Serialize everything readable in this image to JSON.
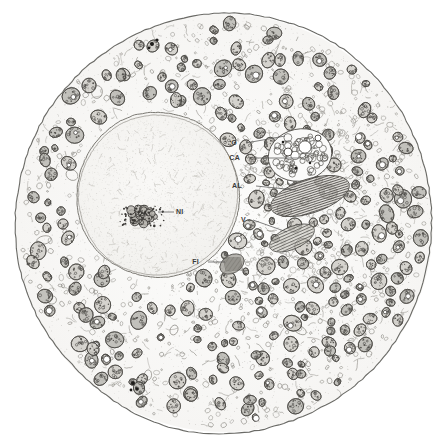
{
  "figure": {
    "kind": "electron-micrograph-drawing",
    "background_color": "#ffffff",
    "ink_color": "#4a4a4a",
    "cytoplasm_tone": "#fbfbfa",
    "nucleoplasm_tone": "#f7f6f4",
    "width": 445,
    "height": 445
  },
  "cell": {
    "center_x": 224,
    "center_y": 223,
    "radius": 209,
    "membrane_color": "#6a6a66"
  },
  "nucleus": {
    "center_x": 158,
    "center_y": 195,
    "radius": 82,
    "envelope_color": "#7a7872"
  },
  "labels": [
    {
      "id": "G",
      "text": "G",
      "x": 237,
      "y": 145,
      "lx1": 246,
      "ly1": 143,
      "lx2": 285,
      "ly2": 136
    },
    {
      "id": "CA",
      "text": "CA",
      "x": 240,
      "y": 160,
      "lx1": 254,
      "ly1": 158,
      "lx2": 300,
      "ly2": 158
    },
    {
      "id": "AL",
      "text": "AL",
      "x": 242,
      "y": 188,
      "lx1": 256,
      "ly1": 186,
      "lx2": 296,
      "ly2": 190
    },
    {
      "id": "V",
      "text": "V",
      "x": 246,
      "y": 222,
      "lx1": 253,
      "ly1": 220,
      "lx2": 287,
      "ly2": 232
    },
    {
      "id": "FI",
      "text": "FI",
      "x": 199,
      "y": 264,
      "lx1": 208,
      "ly1": 262,
      "lx2": 225,
      "ly2": 262
    },
    {
      "id": "NI",
      "text": "NI",
      "x": 176,
      "y": 214,
      "lx1": 174,
      "ly1": 212,
      "lx2": 158,
      "ly2": 212
    }
  ],
  "label_glossary": [
    {
      "id": "G",
      "meaning": "Golgi"
    },
    {
      "id": "CA",
      "meaning": "Canaliculus / vacuolar body"
    },
    {
      "id": "AL",
      "meaning": "Annulate lamellae"
    },
    {
      "id": "V",
      "meaning": "Vesicles"
    },
    {
      "id": "FI",
      "meaning": "Fibrillar body"
    },
    {
      "id": "NI",
      "meaning": "Nucleolus"
    }
  ],
  "structures": {
    "nucleolus": {
      "center_x": 142,
      "center_y": 215,
      "width": 44,
      "height": 22
    },
    "annulate_lamellae": {
      "center_x": 310,
      "center_y": 196,
      "width": 82,
      "height": 34,
      "angle": -18,
      "stripes": 15
    },
    "canalicular_body": {
      "center_x": 300,
      "center_y": 155,
      "width": 64,
      "height": 52
    },
    "fibrillar_body": {
      "center_x": 232,
      "center_y": 264,
      "width": 26,
      "height": 18
    }
  }
}
